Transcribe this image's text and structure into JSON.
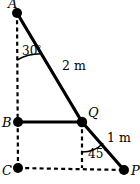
{
  "figure": {
    "background_color": "#ffffff",
    "stroke_color": "#000000",
    "width": 140,
    "height": 184,
    "vertices": [
      {
        "id": "A",
        "label": "A",
        "x": 17,
        "y": 13,
        "label_x": 8,
        "label_y": 6
      },
      {
        "id": "B",
        "label": "B",
        "x": 18,
        "y": 122,
        "label_x": 4,
        "label_y": 126
      },
      {
        "id": "C",
        "label": "C",
        "x": 18,
        "y": 168,
        "label_x": 4,
        "label_y": 174
      },
      {
        "id": "Q",
        "label": "Q",
        "x": 82,
        "y": 122,
        "label_x": 89,
        "label_y": 116
      },
      {
        "id": "P",
        "label": "P",
        "x": 124,
        "y": 170,
        "label_x": 132,
        "label_y": 174
      }
    ],
    "solid_segments": [
      {
        "name": "segment-A-Q",
        "from": "A",
        "to": "Q"
      },
      {
        "name": "segment-B-Q",
        "from": "B",
        "to": "Q"
      },
      {
        "name": "segment-Q-P",
        "from": "Q",
        "to": "P"
      }
    ],
    "dashed_segments": [
      {
        "name": "axis-A-to-C",
        "x1": 17,
        "y1": 13,
        "x2": 18,
        "y2": 168
      },
      {
        "name": "axis-C-to-P",
        "x1": 18,
        "y1": 168,
        "x2": 124,
        "y2": 170
      },
      {
        "name": "axis-Q-vertical",
        "x1": 82,
        "y1": 122,
        "x2": 82,
        "y2": 168
      }
    ],
    "length_labels": [
      {
        "name": "length-AQ",
        "text": "2 m",
        "x": 62,
        "y": 70
      },
      {
        "name": "length-QP",
        "text": "1 m",
        "x": 107,
        "y": 142
      }
    ],
    "angle_labels": [
      {
        "name": "angle-at-A",
        "value": "30",
        "degree_symbol": "°",
        "x": 22,
        "y": 55,
        "arc": {
          "cx": 17,
          "cy": 13,
          "r": 47,
          "start_deg": 90,
          "end_deg": 60
        }
      },
      {
        "name": "angle-at-Q",
        "value": "45",
        "degree_symbol": "°",
        "x": 88,
        "y": 158,
        "arc": {
          "cx": 82,
          "cy": 122,
          "r": 30,
          "start_deg": 270,
          "end_deg": 315
        }
      }
    ]
  }
}
